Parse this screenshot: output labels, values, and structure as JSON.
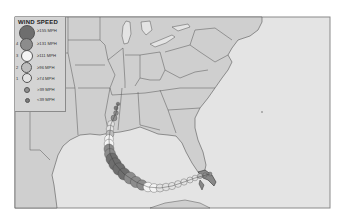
{
  "legend": {
    "title": "WIND SPEED",
    "items": [
      {
        "category": "",
        "label": "≥155 MPH",
        "color": "#6e6e6e",
        "size": 14
      },
      {
        "category": "4",
        "label": "≥131 MPH",
        "color": "#8c8c8c",
        "size": 11
      },
      {
        "category": "3",
        "label": "≥111 MPH",
        "color": "#f4f4f4",
        "size": 10
      },
      {
        "category": "2",
        "label": "≥96 MPH",
        "color": "#bdbdbd",
        "size": 9
      },
      {
        "category": "1",
        "label": "≥74 MPH",
        "color": "#e2e2e2",
        "size": 8
      },
      {
        "category": "",
        "label": ">39 MPH",
        "color": "#8f8f8f",
        "size": 4
      },
      {
        "category": "",
        "label": "<39 MPH",
        "color": "#7a7a7a",
        "size": 3
      }
    ]
  },
  "map": {
    "land_color": "#cfcfcf",
    "water_color": "#e4e4e4",
    "border_color": "#555555"
  }
}
